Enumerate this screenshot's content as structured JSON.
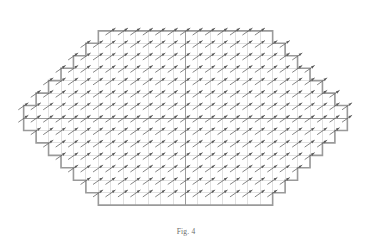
{
  "figure": {
    "caption": "Fig. 4",
    "colors": {
      "background": "#ffffff",
      "boundary": "#9a9a9a",
      "gridline": "#c9c9c9",
      "axis": "#8a8a8a",
      "arrow": "#5a5a5a"
    }
  },
  "chart_data": {
    "type": "scatter",
    "subtitle": "",
    "xlabel": "",
    "ylabel": "",
    "xlim": [
      -13,
      13
    ],
    "ylim": [
      -8,
      8
    ],
    "grid": true,
    "legend_position": "none",
    "tick_labels_x": [],
    "tick_labels_y": [],
    "annotations": [],
    "cell_size": 12.45,
    "origin_px": [
      185.5,
      118.0
    ],
    "arrow_angle_deg": 35,
    "arrow_length_px": 11.5,
    "boundary_half_widths_by_row": [
      {
        "row": -7,
        "half_width": 7
      },
      {
        "row": -6,
        "half_width": 8
      },
      {
        "row": -5,
        "half_width": 9
      },
      {
        "row": -4,
        "half_width": 10
      },
      {
        "row": -3,
        "half_width": 11
      },
      {
        "row": -2,
        "half_width": 12
      },
      {
        "row": -1,
        "half_width": 13
      },
      {
        "row": 0,
        "half_width": 13
      },
      {
        "row": 1,
        "half_width": 12
      },
      {
        "row": 2,
        "half_width": 11
      },
      {
        "row": 3,
        "half_width": 10
      },
      {
        "row": 4,
        "half_width": 9
      },
      {
        "row": 5,
        "half_width": 8
      },
      {
        "row": 6,
        "half_width": 7
      }
    ],
    "series": [
      {
        "name": "field vectors",
        "description": "Uniform up-right oriented vectors sampled at each interior grid node",
        "angle_deg": 35,
        "magnitude": 1.0
      }
    ]
  }
}
